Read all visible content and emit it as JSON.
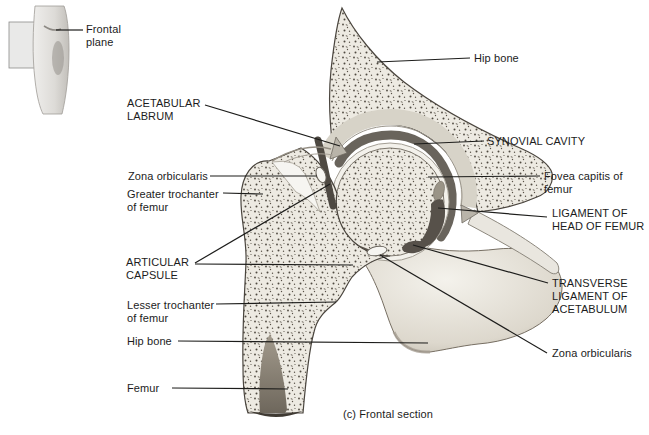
{
  "figure": {
    "caption": "(c) Frontal section"
  },
  "inset": {
    "label": "Frontal\nplane"
  },
  "labels": {
    "acetabular_labrum": "ACETABULAR\nLABRUM",
    "hip_bone_top": "Hip bone",
    "synovial_cavity": "SYNOVIAL CAVITY",
    "zona_orbicularis_left": "Zona orbicularis",
    "greater_trochanter": "Greater trochanter\nof femur",
    "articular_capsule": "ARTICULAR\nCAPSULE",
    "fovea_capitis": "Fovea capitis of\nfemur",
    "ligament_of_head_of_femur": "LIGAMENT OF\nHEAD OF FEMUR",
    "transverse_ligament_of_acetabulum": "TRANSVERSE\nLIGAMENT OF\nACETABULUM",
    "zona_orbicularis_right": "Zona orbicularis",
    "lesser_trochanter": "Lesser trochanter\nof femur",
    "hip_bone_lower": "Hip bone",
    "femur": "Femur"
  },
  "colors": {
    "background": "#ffffff",
    "spongy_bone_fill": "#edeae2",
    "stipple_dots": "#4f4940",
    "synovial_cavity": "#69645c",
    "articular_cartilage": "#f3f1eb",
    "smooth_bone": "#e2ded4",
    "dark_ligament": "#57514a",
    "leader_line": "#1d1d1b",
    "text": "#1c1c1c"
  }
}
